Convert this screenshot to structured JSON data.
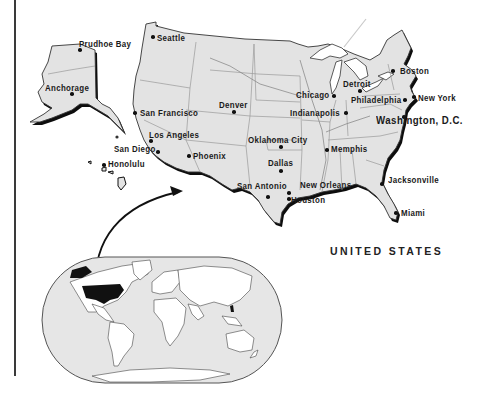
{
  "map": {
    "title": "UNITED STATES",
    "colors": {
      "land": "#e3e3e3",
      "coast_shadow": "#0d0d0d",
      "state_border": "#9a9a9a",
      "outline": "#333333",
      "world_ocean": "#e6e6e6",
      "world_land": "#ffffff",
      "highlight": "#111111"
    },
    "cities": [
      {
        "name": "Prudhoe Bay",
        "label_x": 79,
        "label_y": 40,
        "dot_x": 80,
        "dot_y": 50
      },
      {
        "name": "Seattle",
        "label_x": 157,
        "label_y": 34,
        "dot_x": 153,
        "dot_y": 37
      },
      {
        "name": "Anchorage",
        "label_x": 45,
        "label_y": 84,
        "dot_x": 72,
        "dot_y": 94
      },
      {
        "name": "San Francisco",
        "label_x": 140,
        "label_y": 109,
        "dot_x": 135,
        "dot_y": 113
      },
      {
        "name": "Denver",
        "label_x": 219,
        "label_y": 101,
        "dot_x": 234,
        "dot_y": 112
      },
      {
        "name": "Chicago",
        "label_x": 296,
        "label_y": 91,
        "dot_x": 334,
        "dot_y": 96
      },
      {
        "name": "Detroit",
        "label_x": 343,
        "label_y": 80,
        "dot_x": 360,
        "dot_y": 91
      },
      {
        "name": "Boston",
        "label_x": 400,
        "label_y": 67,
        "dot_x": 393,
        "dot_y": 71
      },
      {
        "name": "Philadelphia",
        "label_x": 351,
        "label_y": 96,
        "dot_x": 405,
        "dot_y": 100
      },
      {
        "name": "New York",
        "label_x": 418,
        "label_y": 94,
        "dot_x": 414,
        "dot_y": 97
      },
      {
        "name": "Indianapolis",
        "label_x": 290,
        "label_y": 109,
        "dot_x": 346,
        "dot_y": 113
      },
      {
        "name": "Washington, D.C.",
        "label_x": 376,
        "label_y": 115,
        "dot_x": 404,
        "dot_y": 117,
        "big": true
      },
      {
        "name": "Los Angeles",
        "label_x": 149,
        "label_y": 131,
        "dot_x": 151,
        "dot_y": 141
      },
      {
        "name": "Oklahoma City",
        "label_x": 248,
        "label_y": 136,
        "dot_x": 281,
        "dot_y": 147
      },
      {
        "name": "Memphis",
        "label_x": 331,
        "label_y": 145,
        "dot_x": 327,
        "dot_y": 150
      },
      {
        "name": "San Diego",
        "label_x": 114,
        "label_y": 145,
        "dot_x": 158,
        "dot_y": 152
      },
      {
        "name": "Phoenix",
        "label_x": 193,
        "label_y": 152,
        "dot_x": 189,
        "dot_y": 156
      },
      {
        "name": "Honolulu",
        "label_x": 108,
        "label_y": 160,
        "dot_x": 104,
        "dot_y": 165
      },
      {
        "name": "Dallas",
        "label_x": 268,
        "label_y": 159,
        "dot_x": 281,
        "dot_y": 171
      },
      {
        "name": "San Antonio",
        "label_x": 237,
        "label_y": 182,
        "dot_x": 268,
        "dot_y": 197
      },
      {
        "name": "New Orleans",
        "label_x": 300,
        "label_y": 181,
        "dot_x": 289,
        "dot_y": 193
      },
      {
        "name": "Houston",
        "label_x": 291,
        "label_y": 196,
        "dot_x": 289,
        "dot_y": 199
      },
      {
        "name": "Jacksonville",
        "label_x": 388,
        "label_y": 176,
        "dot_x": 382,
        "dot_y": 184
      },
      {
        "name": "Miami",
        "label_x": 401,
        "label_y": 209,
        "dot_x": 396,
        "dot_y": 213
      }
    ],
    "inset": {
      "label": "World locator map",
      "highlighted_country": "United States"
    }
  }
}
